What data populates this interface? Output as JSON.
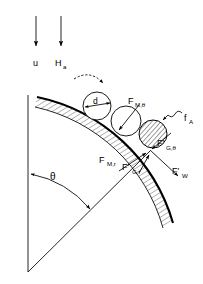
{
  "figure": {
    "background_color": "#ffffff",
    "ink_color": "#000000",
    "width": 203,
    "height": 284
  },
  "flow": {
    "arrows": [
      {
        "name": "velocity-arrow",
        "label": "u",
        "subscript": "",
        "x": 36,
        "y_start": 16,
        "y_end": 48
      },
      {
        "name": "field-arrow",
        "label": "H",
        "subscript": "a",
        "x": 60,
        "y_start": 16,
        "y_end": 48
      }
    ]
  },
  "labels": {
    "velocity": "u",
    "field": "H",
    "field_sub": "a",
    "diameter": "d",
    "angle": "θ",
    "adhesion": "f",
    "adhesion_sub": "A",
    "magnetic_tangential": "F",
    "magnetic_tangential_sub": "M,θ",
    "magnetic_radial": "F",
    "magnetic_radial_sub": "M,r",
    "gravity_tangential": "F′",
    "gravity_tangential_sub": "G,θ",
    "gravity_radial": "F′",
    "gravity_radial_sub": "G,r",
    "drag": "F′",
    "drag_sub": "W"
  },
  "geometry": {
    "axis_line": {
      "x": 28,
      "y_top": 95,
      "y_bottom": 272
    },
    "apex": {
      "x": 28,
      "y": 272
    },
    "radius_line_end": {
      "x": 150,
      "y": 151
    },
    "wall_arc": {
      "start_x": 37,
      "start_y": 97,
      "end_x": 173,
      "end_y": 223
    },
    "contact_point": {
      "x": 149,
      "y": 151
    },
    "angle_value_deg": 52
  },
  "particles": [
    {
      "name": "particle-upstream",
      "cx": 97,
      "cy": 106,
      "r": 14,
      "hatched": false
    },
    {
      "name": "particle-midstream",
      "cx": 126,
      "cy": 121,
      "r": 15,
      "hatched": false
    },
    {
      "name": "particle-at-wall",
      "cx": 153,
      "cy": 134,
      "r": 14,
      "hatched": true
    }
  ],
  "force_vectors": [
    {
      "name": "force-magnetic-tangential",
      "label_key": "magnetic_tangential",
      "from_x": 138,
      "from_y": 106,
      "to_x": 120,
      "to_y": 129
    },
    {
      "name": "force-gravity-tangential",
      "label_key": "gravity_tangential",
      "from_x": 172,
      "from_y": 132,
      "to_x": 152,
      "to_y": 148
    },
    {
      "name": "force-magnetic-radial",
      "label_key": "magnetic_radial",
      "from_x": 120,
      "from_y": 170,
      "to_x": 147,
      "to_y": 152
    },
    {
      "name": "force-gravity-radial",
      "label_key": "gravity_radial",
      "from_x": 140,
      "from_y": 172,
      "to_x": 150,
      "to_y": 154
    },
    {
      "name": "force-drag",
      "label_key": "drag",
      "from_x": 150,
      "from_y": 151,
      "to_x": 179,
      "to_y": 177
    }
  ],
  "annotations": {
    "motion_arc_name": "particle-motion-arrow",
    "adhesion_leader_name": "adhesion-leader-squiggle",
    "diameter_name": "diameter-dimension-arrow",
    "angle_arc_name": "angle-arc-arrow"
  }
}
